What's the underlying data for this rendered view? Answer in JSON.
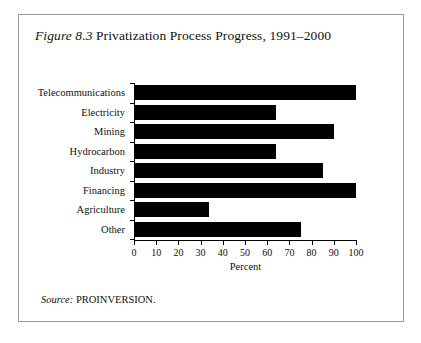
{
  "figure": {
    "label_word": "Figure",
    "number": "8.3",
    "title": "Privatization Process Progress, 1991–2000",
    "source_label": "Source:",
    "source_value": "PROINVERSION."
  },
  "chart_data": {
    "type": "bar",
    "orientation": "horizontal",
    "title": "Figure 8.3 Privatization Process Progress, 1991–2000",
    "categories": [
      "Telecommunications",
      "Electricity",
      "Mining",
      "Hydrocarbon",
      "Industry",
      "Financing",
      "Agriculture",
      "Other"
    ],
    "values": [
      100,
      64,
      90,
      64,
      85,
      100,
      34,
      75
    ],
    "xlabel": "Percent",
    "ylabel": "",
    "xlim": [
      0,
      100
    ],
    "xticks": [
      0,
      10,
      20,
      30,
      40,
      50,
      60,
      70,
      80,
      90,
      100
    ],
    "xticklabels": [
      "0",
      "10",
      "20",
      "30",
      "40",
      "50",
      "60",
      "70",
      "80",
      "90",
      "100"
    ],
    "grid": false,
    "legend": false,
    "bar_color": "#000000"
  },
  "style": {
    "frame_color": "#9a9a9a",
    "background": "#ffffff",
    "axis_color": "#000000"
  }
}
